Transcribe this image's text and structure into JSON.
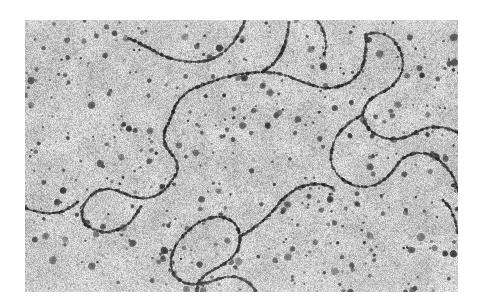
{
  "image": {
    "kind": "electron-micrograph",
    "subject": "DNA molecules",
    "modality": "transmission electron microscopy",
    "caption": "",
    "page_background": "#ffffff",
    "frame": {
      "left": 25,
      "top": 20,
      "width": 433,
      "height": 272
    },
    "palette": {
      "background_mean": "#c9c9c9",
      "background_light": "#e2e2e2",
      "background_dark": "#9a9a9a",
      "grain_dark": "#6e6e6e",
      "particle_dark": "#2a2a2a",
      "particle_mid": "#4a4a4a",
      "filament_dark": "#232323",
      "filament_mid": "#454545",
      "halo_light": "#dedede",
      "border": "#ffffff"
    },
    "texture": {
      "grain_density": 16000,
      "grain_min_radius": 0.4,
      "grain_max_radius": 1.2,
      "particle_count": 430,
      "particle_min_radius": 1.3,
      "particle_max_radius": 4.2,
      "noise_seed": 20240917
    },
    "filaments": [
      {
        "name": "filament-top-arc",
        "bead_spacing": 2.0,
        "thickness": 2.1,
        "halo": 3.4,
        "points": [
          [
            103,
            18
          ],
          [
            112,
            22
          ],
          [
            122,
            27
          ],
          [
            133,
            33
          ],
          [
            145,
            38
          ],
          [
            158,
            41
          ],
          [
            171,
            42
          ],
          [
            184,
            40
          ],
          [
            196,
            34
          ],
          [
            205,
            26
          ],
          [
            212,
            17
          ],
          [
            217,
            8
          ],
          [
            220,
            0
          ]
        ]
      },
      {
        "name": "filament-central-long",
        "bead_spacing": 2.0,
        "thickness": 2.1,
        "halo": 3.4,
        "points": [
          [
            148,
            92
          ],
          [
            152,
            83
          ],
          [
            158,
            76
          ],
          [
            166,
            70
          ],
          [
            175,
            66
          ],
          [
            186,
            62
          ],
          [
            198,
            58
          ],
          [
            211,
            55
          ],
          [
            224,
            53
          ],
          [
            237,
            52
          ],
          [
            250,
            53
          ],
          [
            262,
            56
          ],
          [
            273,
            60
          ],
          [
            284,
            64
          ],
          [
            294,
            67
          ],
          [
            305,
            68
          ],
          [
            316,
            66
          ],
          [
            326,
            61
          ],
          [
            333,
            54
          ],
          [
            338,
            45
          ],
          [
            340,
            35
          ],
          [
            341,
            25
          ],
          [
            341,
            15
          ]
        ]
      },
      {
        "name": "filament-central-descend",
        "bead_spacing": 2.0,
        "thickness": 2.1,
        "halo": 3.4,
        "points": [
          [
            148,
            92
          ],
          [
            145,
            100
          ],
          [
            141,
            108
          ],
          [
            139,
            116
          ],
          [
            140,
            124
          ],
          [
            144,
            131
          ],
          [
            149,
            137
          ],
          [
            152,
            144
          ],
          [
            152,
            152
          ],
          [
            148,
            159
          ],
          [
            143,
            166
          ],
          [
            137,
            172
          ],
          [
            130,
            176
          ],
          [
            122,
            178
          ],
          [
            114,
            178
          ],
          [
            106,
            176
          ],
          [
            98,
            173
          ],
          [
            90,
            170
          ],
          [
            82,
            169
          ],
          [
            75,
            170
          ]
        ]
      },
      {
        "name": "filament-left-low-loop",
        "bead_spacing": 2.0,
        "thickness": 2.1,
        "halo": 3.4,
        "points": [
          [
            75,
            170
          ],
          [
            68,
            174
          ],
          [
            62,
            180
          ],
          [
            58,
            188
          ],
          [
            57,
            196
          ],
          [
            60,
            203
          ],
          [
            66,
            208
          ],
          [
            74,
            211
          ],
          [
            83,
            212
          ],
          [
            92,
            210
          ],
          [
            100,
            206
          ],
          [
            107,
            200
          ],
          [
            112,
            193
          ],
          [
            116,
            186
          ]
        ]
      },
      {
        "name": "filament-mid-upper-right-branch",
        "bead_spacing": 2.0,
        "thickness": 2.1,
        "halo": 3.4,
        "points": [
          [
            237,
            52
          ],
          [
            246,
            46
          ],
          [
            253,
            38
          ],
          [
            258,
            29
          ],
          [
            261,
            20
          ],
          [
            263,
            11
          ],
          [
            264,
            2
          ]
        ]
      },
      {
        "name": "filament-right-upper-curve",
        "bead_spacing": 2.0,
        "thickness": 2.1,
        "halo": 3.4,
        "points": [
          [
            341,
            15
          ],
          [
            349,
            13
          ],
          [
            358,
            14
          ],
          [
            366,
            18
          ],
          [
            372,
            25
          ],
          [
            376,
            33
          ],
          [
            378,
            42
          ],
          [
            377,
            51
          ],
          [
            373,
            59
          ],
          [
            367,
            66
          ],
          [
            360,
            71
          ],
          [
            352,
            75
          ],
          [
            345,
            80
          ],
          [
            340,
            87
          ],
          [
            338,
            95
          ],
          [
            340,
            103
          ],
          [
            345,
            110
          ],
          [
            352,
            115
          ],
          [
            360,
            118
          ],
          [
            369,
            119
          ],
          [
            378,
            118
          ],
          [
            386,
            115
          ],
          [
            394,
            111
          ],
          [
            402,
            108
          ],
          [
            411,
            107
          ],
          [
            420,
            108
          ],
          [
            429,
            111
          ],
          [
            437,
            116
          ],
          [
            444,
            122
          ],
          [
            450,
            129
          ]
        ]
      },
      {
        "name": "filament-right-mid-loop",
        "bead_spacing": 2.0,
        "thickness": 2.1,
        "halo": 3.4,
        "points": [
          [
            338,
            95
          ],
          [
            330,
            99
          ],
          [
            322,
            105
          ],
          [
            315,
            112
          ],
          [
            310,
            120
          ],
          [
            307,
            129
          ],
          [
            306,
            138
          ],
          [
            308,
            147
          ],
          [
            313,
            155
          ],
          [
            320,
            161
          ],
          [
            328,
            165
          ],
          [
            337,
            167
          ],
          [
            346,
            166
          ],
          [
            354,
            163
          ],
          [
            361,
            158
          ],
          [
            367,
            152
          ],
          [
            372,
            145
          ],
          [
            377,
            139
          ],
          [
            384,
            135
          ],
          [
            392,
            133
          ],
          [
            401,
            134
          ],
          [
            409,
            137
          ],
          [
            416,
            142
          ],
          [
            422,
            148
          ],
          [
            427,
            155
          ]
        ]
      },
      {
        "name": "filament-right-edge-short",
        "bead_spacing": 2.0,
        "thickness": 2.1,
        "halo": 3.4,
        "points": [
          [
            418,
            180
          ],
          [
            424,
            187
          ],
          [
            428,
            195
          ],
          [
            431,
            204
          ],
          [
            433,
            213
          ]
        ]
      },
      {
        "name": "filament-lower-center-loop",
        "bead_spacing": 2.0,
        "thickness": 2.1,
        "halo": 3.4,
        "points": [
          [
            158,
            216
          ],
          [
            165,
            209
          ],
          [
            173,
            203
          ],
          [
            182,
            199
          ],
          [
            191,
            197
          ],
          [
            200,
            198
          ],
          [
            208,
            202
          ],
          [
            213,
            209
          ],
          [
            215,
            217
          ],
          [
            214,
            226
          ],
          [
            210,
            234
          ],
          [
            204,
            240
          ],
          [
            197,
            245
          ],
          [
            190,
            249
          ],
          [
            183,
            253
          ],
          [
            177,
            258
          ],
          [
            173,
            264
          ],
          [
            172,
            272
          ]
        ]
      },
      {
        "name": "filament-lower-center-return",
        "bead_spacing": 2.0,
        "thickness": 2.1,
        "halo": 3.4,
        "points": [
          [
            158,
            216
          ],
          [
            152,
            224
          ],
          [
            148,
            232
          ],
          [
            146,
            241
          ],
          [
            147,
            250
          ],
          [
            151,
            257
          ],
          [
            158,
            262
          ],
          [
            166,
            264
          ],
          [
            175,
            264
          ],
          [
            184,
            262
          ],
          [
            193,
            259
          ],
          [
            202,
            257
          ],
          [
            211,
            257
          ],
          [
            219,
            260
          ],
          [
            226,
            265
          ],
          [
            231,
            271
          ]
        ]
      },
      {
        "name": "filament-lower-right-tail",
        "bead_spacing": 2.0,
        "thickness": 2.1,
        "halo": 3.4,
        "points": [
          [
            215,
            217
          ],
          [
            223,
            212
          ],
          [
            231,
            206
          ],
          [
            239,
            200
          ],
          [
            246,
            193
          ],
          [
            252,
            186
          ],
          [
            258,
            179
          ],
          [
            265,
            173
          ],
          [
            273,
            168
          ],
          [
            282,
            165
          ],
          [
            291,
            164
          ],
          [
            300,
            165
          ],
          [
            308,
            168
          ]
        ]
      },
      {
        "name": "filament-lower-left-edge",
        "bead_spacing": 2.0,
        "thickness": 2.1,
        "halo": 3.4,
        "points": [
          [
            0,
            188
          ],
          [
            9,
            191
          ],
          [
            19,
            193
          ],
          [
            29,
            193
          ],
          [
            38,
            191
          ],
          [
            46,
            187
          ],
          [
            53,
            182
          ]
        ]
      },
      {
        "name": "filament-top-right-faint",
        "bead_spacing": 2.2,
        "thickness": 1.8,
        "halo": 3.0,
        "points": [
          [
            292,
            0
          ],
          [
            297,
            8
          ],
          [
            300,
            17
          ],
          [
            301,
            26
          ],
          [
            299,
            35
          ]
        ]
      },
      {
        "name": "filament-far-right-stub",
        "bead_spacing": 2.2,
        "thickness": 1.8,
        "halo": 3.0,
        "points": [
          [
            427,
            155
          ],
          [
            431,
            163
          ],
          [
            433,
            172
          ]
        ]
      }
    ]
  }
}
